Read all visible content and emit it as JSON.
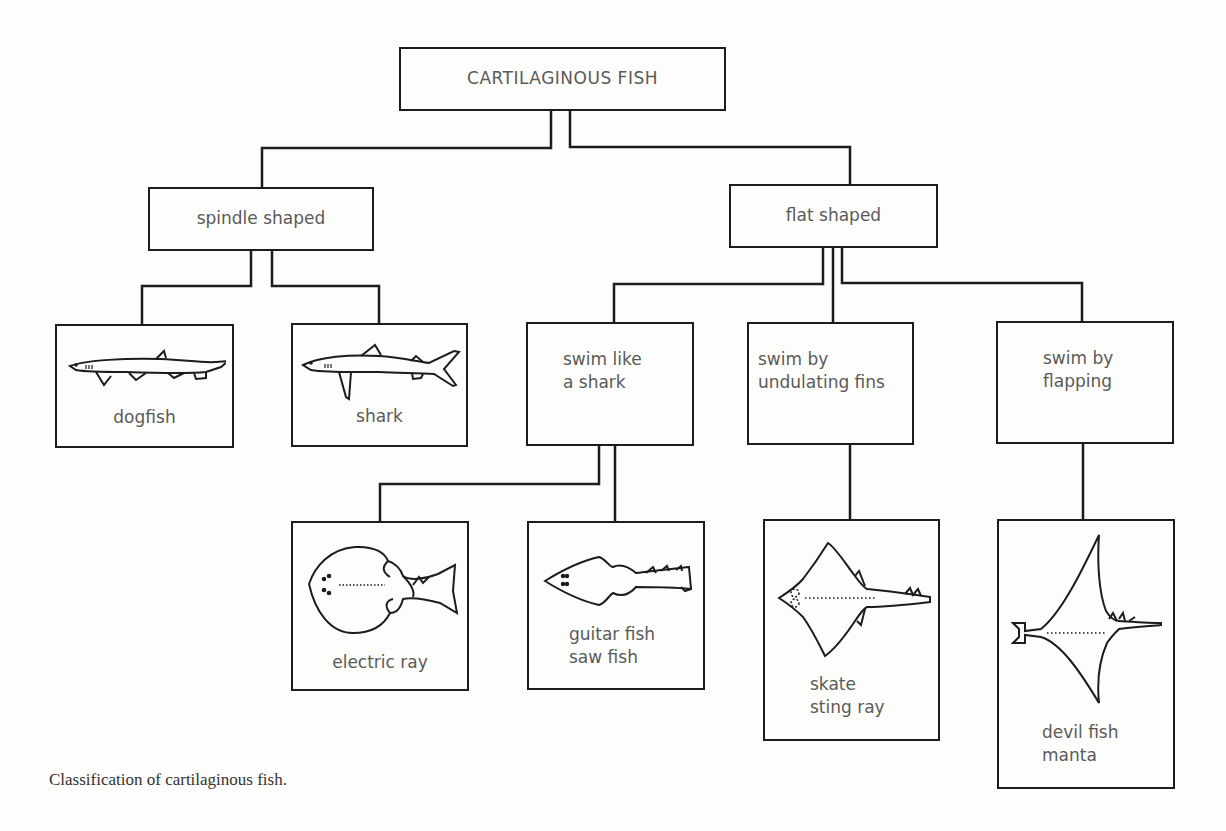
{
  "diagram": {
    "root": {
      "label": "CARTILAGINOUS FISH"
    },
    "groups": {
      "spindle": {
        "label": "spindle shaped"
      },
      "flat": {
        "label": "flat shaped"
      }
    },
    "spindle_children": [
      {
        "id": "dogfish",
        "label": "dogfish",
        "icon": "dogfish-icon"
      },
      {
        "id": "shark",
        "label": "shark",
        "icon": "shark-icon"
      }
    ],
    "flat_children": [
      {
        "id": "swim-like-shark",
        "label": "swim like\na shark"
      },
      {
        "id": "swim-undulating",
        "label": "swim by\nundulating fins"
      },
      {
        "id": "swim-flapping",
        "label": "swim by\nflapping"
      }
    ],
    "leaves": {
      "electric_ray": {
        "label": "electric ray",
        "icon": "electric-ray-icon"
      },
      "guitar_fish": {
        "label": "guitar fish\nsaw fish",
        "icon": "guitar-fish-icon"
      },
      "skate": {
        "label": "skate\nsting ray",
        "icon": "skate-icon"
      },
      "manta": {
        "label": "devil fish\nmanta",
        "icon": "manta-icon"
      }
    }
  },
  "caption": "Classification of cartilaginous fish.",
  "colors": {
    "line": "#1c1c1c",
    "text": "#5a5a5a",
    "background": "#fdfdfc"
  }
}
